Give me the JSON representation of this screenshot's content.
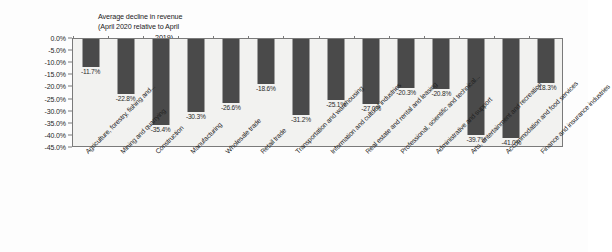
{
  "chart_data": {
    "type": "bar",
    "title": "Average decline in revenue (April 2020 relative to April 2019)",
    "title_lines": [
      "Average decline in revenue",
      "(April 2020 relative to April",
      "2019)"
    ],
    "xlabel": "",
    "ylabel": "",
    "ylim": [
      -45,
      0
    ],
    "ytick_labels": [
      "0.0%",
      "-5.0%",
      "-10.0%",
      "-15.0%",
      "-20.0%",
      "-25.0%",
      "-30.0%",
      "-35.0%",
      "-40.0%",
      "-45.0%"
    ],
    "ytick_values": [
      0,
      -5,
      -10,
      -15,
      -20,
      -25,
      -30,
      -35,
      -40,
      -45
    ],
    "grid": false,
    "legend": "none",
    "bar_color": "#4a4a4a",
    "plot_background": "#f2f2f0",
    "categories": [
      "Agriculture, forestry, fishing and...",
      "Mining and quarrying",
      "Construction",
      "Manufacturing",
      "Wholesale trade",
      "Retail trade",
      "Transportation and warehousing",
      "Information and cultural industries",
      "Real estate and rental and leasing",
      "Professional, scientific and technical...",
      "Administrative and support",
      "Arts, entertainment and recreation",
      "Accommodation and food services",
      "Finance and insurance industries"
    ],
    "values": [
      -11.7,
      -22.8,
      -35.4,
      -30.3,
      -26.6,
      -18.6,
      -31.2,
      -25.1,
      -27.0,
      -20.3,
      -20.8,
      -39.7,
      -41.0,
      -18.3
    ],
    "data_labels": [
      "-11.7%",
      "-22.8%",
      "-35.4%",
      "-30.3%",
      "-26.6%",
      "-18.6%",
      "-31.2%",
      "-25.1%",
      "-27.0%",
      "-20.3%",
      "-20.8%",
      "-39.7%",
      "-41.0%",
      "-18.3%"
    ]
  }
}
